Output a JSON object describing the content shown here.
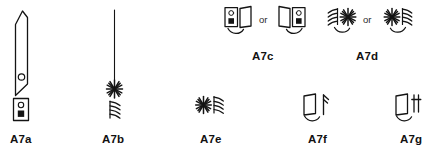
{
  "sheet": {
    "title": "Symbol legend A7",
    "background_color": "#ffffff",
    "ink_color": "#141414",
    "width": 432,
    "height": 155
  },
  "conjunction": {
    "or_label": "or"
  },
  "symbols": [
    {
      "id": "A7a",
      "label": "A7a",
      "description": "Tall slanted blade panel with circular port and detector box beneath",
      "variants": 1,
      "row": "bottom",
      "label_x": 10,
      "label_y": 134
    },
    {
      "id": "A7b",
      "label": "A7b",
      "description": "Vertical mast line terminating in starburst emitter above stacked wavy rays",
      "variants": 1,
      "row": "bottom",
      "label_x": 102,
      "label_y": 134
    },
    {
      "id": "A7c",
      "label": "A7c",
      "description": "Detector box with swing panel and arc, shown in left and right mirrored forms",
      "variants": 2,
      "row": "top",
      "label_x": 252,
      "label_y": 51
    },
    {
      "id": "A7d",
      "label": "A7d",
      "description": "Starburst emitter with wavy rays and swing arc, shown in left and right mirrored forms",
      "variants": 2,
      "row": "top",
      "label_x": 356,
      "label_y": 51
    },
    {
      "id": "A7e",
      "label": "A7e",
      "description": "Starburst emitter with wavy rays to the right",
      "variants": 1,
      "row": "bottom",
      "label_x": 200,
      "label_y": 134
    },
    {
      "id": "A7f",
      "label": "A7f",
      "description": "Swing panel with arc beside upward arrow post",
      "variants": 1,
      "row": "bottom",
      "label_x": 308,
      "label_y": 134
    },
    {
      "id": "A7g",
      "label": "A7g",
      "description": "Swing panel with arc beside cross-barred post",
      "variants": 1,
      "row": "bottom",
      "label_x": 400,
      "label_y": 134
    }
  ]
}
